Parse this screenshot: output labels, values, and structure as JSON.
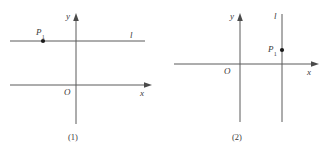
{
  "figure": {
    "type": "geometry-diagram",
    "stroke_color": "#5a5a5a",
    "text_color": "#3a3a3a",
    "background": "#ffffff"
  },
  "panels": [
    {
      "id": "panel-1",
      "caption": "(1)",
      "axes": {
        "y_label": "y",
        "x_label": "x",
        "origin_label": "O"
      },
      "line": {
        "label": "l",
        "orientation": "horizontal",
        "position": "above the x-axis, crossing the y-axis"
      },
      "point": {
        "label": "P",
        "subscript": "1",
        "position": "on line l, left of the y-axis"
      }
    },
    {
      "id": "panel-2",
      "caption": "(2)",
      "axes": {
        "y_label": "y",
        "x_label": "x",
        "origin_label": "O"
      },
      "line": {
        "label": "l",
        "orientation": "vertical",
        "position": "right of the y-axis, crossing the x-axis"
      },
      "point": {
        "label": "P",
        "subscript": "1",
        "position": "on line l, above the x-axis"
      }
    }
  ]
}
